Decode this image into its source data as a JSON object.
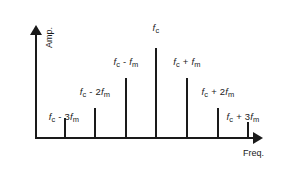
{
  "figure": {
    "title": "",
    "background_color": "#ffffff",
    "line_color": "#1a1a1a"
  },
  "axes": {
    "y_title": "Amp.",
    "x_title": "Freq.",
    "y_arrow_icon": "arrow-up-icon",
    "x_arrow_icon": "arrow-right-icon"
  },
  "chart_data": {
    "type": "bar",
    "title": "",
    "xlabel": "Freq.",
    "ylabel": "Amp.",
    "grid": false,
    "legend": false,
    "axis_arrows": true,
    "categories": [
      "fc - 3fm",
      "fc - 2fm",
      "fc - fm",
      "fc",
      "fc + fm",
      "fc + 2fm",
      "fc + 3fm"
    ],
    "values": [
      20,
      30,
      60,
      90,
      60,
      30,
      16
    ],
    "ylim": [
      0,
      110
    ],
    "annotations": [
      {
        "label_base": "f",
        "label_sub": "c",
        "label_suffix": " - 3",
        "second_base": "f",
        "second_sub": "m"
      }
    ],
    "points": [
      {
        "id": "line-1",
        "label_html": "<i>f</i><sub>c</sub> - 3<i>f</i><sub>m</sub>",
        "label_text": "fc - 3fm",
        "x_px": 64,
        "height": 20,
        "top_px": 118,
        "label_x_px": 64,
        "label_y_px": 111
      },
      {
        "id": "line-2",
        "label_html": "<i>f</i><sub>c</sub> - 2<i>f</i><sub>m</sub>",
        "label_text": "fc - 2fm",
        "x_px": 94,
        "height": 30,
        "top_px": 108,
        "label_x_px": 95,
        "label_y_px": 86
      },
      {
        "id": "line-3",
        "label_html": "<i>f</i><sub>c</sub> - <i>f</i><sub>m</sub>",
        "label_text": "fc - fm",
        "x_px": 125,
        "height": 60,
        "top_px": 78,
        "label_x_px": 126,
        "label_y_px": 56
      },
      {
        "id": "line-4",
        "label_html": "<i>f</i><sub>c</sub>",
        "label_text": "fc",
        "x_px": 155,
        "height": 90,
        "top_px": 48,
        "label_x_px": 156,
        "label_y_px": 22
      },
      {
        "id": "line-5",
        "label_html": "<i>f</i><sub>c</sub> + <i>f</i><sub>m</sub>",
        "label_text": "fc + fm",
        "x_px": 186,
        "height": 60,
        "top_px": 78,
        "label_x_px": 187,
        "label_y_px": 56
      },
      {
        "id": "line-6",
        "label_html": "<i>f</i><sub>c</sub> + 2<i>f</i><sub>m</sub>",
        "label_text": "fc + 2fm",
        "x_px": 217,
        "height": 30,
        "top_px": 108,
        "label_x_px": 218,
        "label_y_px": 86
      },
      {
        "id": "line-7",
        "label_html": "<i>f</i><sub>c</sub> + 3<i>f</i><sub>m</sub>",
        "label_text": "fc + 3fm",
        "x_px": 247,
        "height": 16,
        "top_px": 122,
        "label_x_px": 243,
        "label_y_px": 111
      }
    ]
  }
}
